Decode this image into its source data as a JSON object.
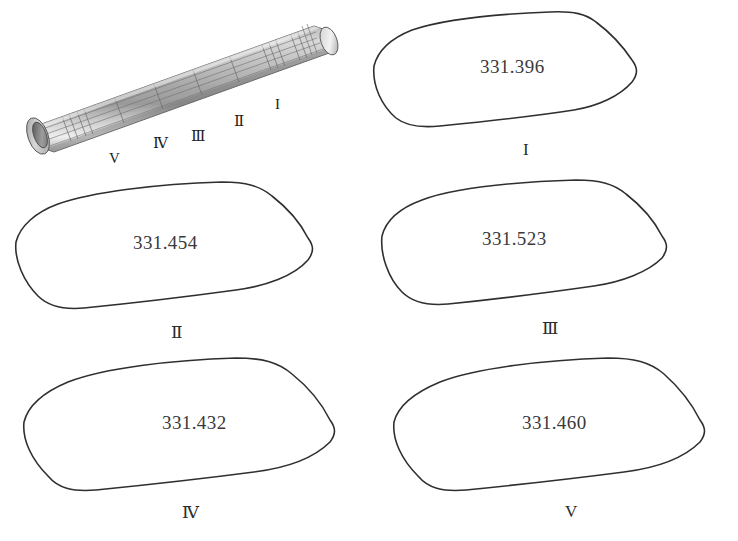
{
  "figure": {
    "type": "technical-illustration",
    "background_color": "#ffffff",
    "outline_color": "#2f2f2f",
    "text_color": "#3a3a3a"
  },
  "tube": {
    "name": "tube-3d-model",
    "surface_color_light": "#e8e8e8",
    "surface_color_mid": "#bdbdbd",
    "surface_color_dark": "#8e8e8e",
    "mesh_line_color": "#6a6a6a",
    "station_labels": [
      {
        "label": "I",
        "x": 275,
        "y": 96
      },
      {
        "label": "Ⅱ",
        "x": 234,
        "y": 112
      },
      {
        "label": "Ⅲ",
        "x": 190,
        "y": 128
      },
      {
        "label": "Ⅳ",
        "x": 152,
        "y": 134
      },
      {
        "label": "V",
        "x": 107,
        "y": 150
      }
    ]
  },
  "sections": [
    {
      "id": "section-1",
      "label": "I",
      "value": "331.396",
      "panel": {
        "left": 368,
        "top": 4,
        "width": 330,
        "height": 170
      },
      "value_pos": {
        "left": 112,
        "top": 58
      },
      "label_pos": {
        "left": 152,
        "top": 138
      }
    },
    {
      "id": "section-2",
      "label": "Ⅱ",
      "value": "331.454",
      "panel": {
        "left": 8,
        "top": 176,
        "width": 330,
        "height": 172
      },
      "value_pos": {
        "left": 128,
        "top": 60
      },
      "label_pos": {
        "left": 163,
        "top": 142
      }
    },
    {
      "id": "section-3",
      "label": "Ⅲ",
      "value": "331.523",
      "panel": {
        "left": 374,
        "top": 176,
        "width": 330,
        "height": 172
      },
      "value_pos": {
        "left": 110,
        "top": 56
      },
      "label_pos": {
        "left": 168,
        "top": 138
      }
    },
    {
      "id": "section-4",
      "label": "Ⅳ",
      "value": "331.432",
      "panel": {
        "left": 14,
        "top": 350,
        "width": 340,
        "height": 178
      },
      "value_pos": {
        "left": 148,
        "top": 58
      },
      "label_pos": {
        "left": 168,
        "top": 142
      }
    },
    {
      "id": "section-5",
      "label": "V",
      "value": "331.460",
      "panel": {
        "left": 382,
        "top": 350,
        "width": 340,
        "height": 178
      },
      "value_pos": {
        "left": 140,
        "top": 58
      },
      "label_pos": {
        "left": 178,
        "top": 142
      }
    }
  ]
}
